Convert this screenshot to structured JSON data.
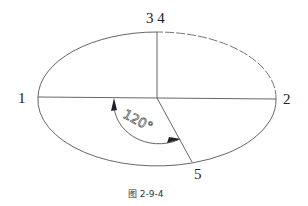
{
  "figure": {
    "caption": "图 2-9-4",
    "points": {
      "p1": "1",
      "p2": "2",
      "p34": "3 4",
      "p5": "5"
    },
    "angle_label": "120°",
    "angle_degrees": 120,
    "line_color": "#444444"
  }
}
